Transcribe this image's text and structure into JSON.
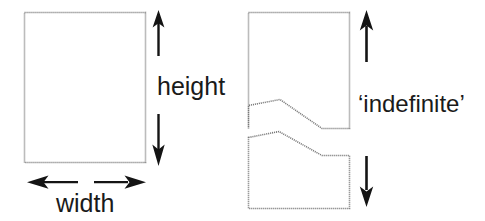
{
  "figure": {
    "background_color": "#ffffff",
    "stroke_color": "#6e6e6e",
    "arrow_color": "#111111",
    "text_color": "#1a1a1a"
  },
  "left_panel": {
    "name": "finite-rectangle",
    "shape": "rectangle",
    "labels": {
      "height": "height",
      "width": "width"
    },
    "arrows": {
      "height_up": "arrow-up",
      "height_down": "arrow-down",
      "width_left": "arrow-left",
      "width_right": "arrow-right"
    },
    "geometry": {
      "x": 24,
      "y": 12,
      "width": 122,
      "height": 151
    }
  },
  "right_panel": {
    "name": "indefinite-rectangle",
    "shape": "broken-rectangle",
    "labels": {
      "indefinite": "‘indefinite’"
    },
    "arrows": {
      "height_up": "arrow-up",
      "height_down": "arrow-down"
    },
    "geometry": {
      "x": 248,
      "y": 12,
      "width": 102,
      "top_part_height": 116,
      "bottom_part_height": 52
    }
  }
}
